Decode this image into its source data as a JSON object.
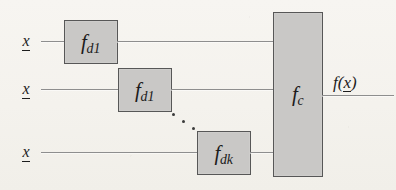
{
  "figure": {
    "type": "block-diagram",
    "background_color": "#f6f4f0",
    "box_fill_color": "#c9c8c6",
    "box_border_color": "#575757",
    "line_color": "#8e8e8e",
    "text_color": "#1d1d1d"
  },
  "inputs": [
    {
      "id": "input-1",
      "label": "x",
      "vector_notation": "underline"
    },
    {
      "id": "input-2",
      "label": "x",
      "vector_notation": "underline"
    },
    {
      "id": "input-3",
      "label": "x",
      "vector_notation": "underline"
    }
  ],
  "modules": [
    {
      "id": "module-1",
      "base": "f",
      "subscript": "d1",
      "label": "f d1"
    },
    {
      "id": "module-2",
      "base": "f",
      "subscript": "d1",
      "label": "f d1"
    },
    {
      "id": "module-3",
      "base": "f",
      "subscript": "dk",
      "label": "f dk"
    }
  ],
  "combiner": {
    "id": "combiner",
    "base": "f",
    "subscript": "c",
    "label": "f c"
  },
  "output": {
    "id": "output",
    "prefix": "f(",
    "variable": "x",
    "suffix": ")",
    "label": "f(x)",
    "vector_notation": "underline"
  },
  "ellipsis": {
    "label": "...",
    "dot_count": 3,
    "meaning": "additional modules between the second and the k-th"
  }
}
